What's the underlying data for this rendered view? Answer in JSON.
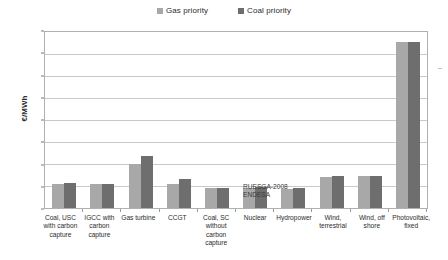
{
  "chart_data": {
    "type": "bar",
    "title": "",
    "xlabel": "",
    "ylabel": "€/MWh",
    "ylim": [
      0,
      400
    ],
    "ytick_step": 50,
    "yticks": [
      "400",
      "350",
      "300",
      "250",
      "200",
      "150",
      "100",
      "50",
      "0"
    ],
    "grid": true,
    "legend_position": "top-center",
    "categories": [
      "Coal, USC with carbon capture",
      "IGCC with carbon capture",
      "Gas turbine",
      "CCGT",
      "Coal, SC without carbon capture",
      "Nuclear",
      "Hydropower",
      "Wind, terrestrial",
      "Wind, off shore",
      "Photovoltaic, fixed"
    ],
    "series": [
      {
        "name": "Gas priority",
        "color": "#a8a8a8",
        "values": [
          55,
          54,
          101,
          55,
          45,
          46,
          44,
          70,
          72,
          378
        ]
      },
      {
        "name": "Coal priority",
        "color": "#6e6e6e",
        "values": [
          56,
          54,
          119,
          66,
          45,
          48,
          45,
          72,
          73,
          378
        ]
      }
    ],
    "annotations": [
      {
        "line1": "RUESGA-2008",
        "line2": "ENDESA"
      }
    ]
  },
  "legend": {
    "items": [
      {
        "label": "Gas priority",
        "color": "#a8a8a8"
      },
      {
        "label": "Coal priority",
        "color": "#6e6e6e"
      }
    ]
  },
  "axis": {
    "y_title": "€/MWh"
  },
  "annotation": {
    "line1": "RUESGA-2008",
    "line2": "ENDESA"
  }
}
